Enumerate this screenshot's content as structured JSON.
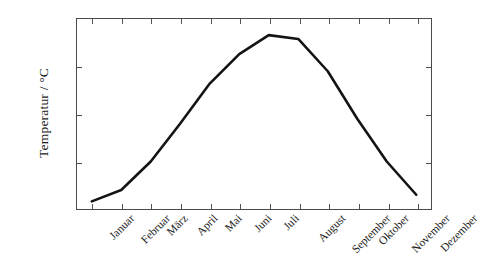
{
  "chart_data": {
    "type": "line",
    "title": "",
    "subtitle": "",
    "xlabel": "",
    "ylabel": "Temperatur / °C",
    "categories": [
      "Januar",
      "Februar",
      "März",
      "April",
      "Mai",
      "Juni",
      "Juli",
      "August",
      "September",
      "Oktober",
      "November",
      "Dezember"
    ],
    "values": [
      0.8,
      2.0,
      5.0,
      9.0,
      13.2,
      16.3,
      18.3,
      17.9,
      14.5,
      9.5,
      5.0,
      1.5
    ],
    "series": [
      {
        "name": "Temperatur",
        "values": [
          0.8,
          2.0,
          5.0,
          9.0,
          13.2,
          16.3,
          18.3,
          17.9,
          14.5,
          9.5,
          5.0,
          1.5
        ],
        "color": "#141414"
      }
    ],
    "ylim": [
      0,
      20
    ],
    "y_ticks": [
      0,
      5,
      10,
      15,
      20
    ],
    "y_tick_labels": [
      "0",
      "5",
      "10",
      "15",
      "20"
    ],
    "grid": false,
    "legend": false,
    "legend_position": "none",
    "x_tick_rotation": -45,
    "units": "°C"
  },
  "axis": {
    "y_title": "Temperatur / °C",
    "frame_color": "#4a4a4a"
  }
}
